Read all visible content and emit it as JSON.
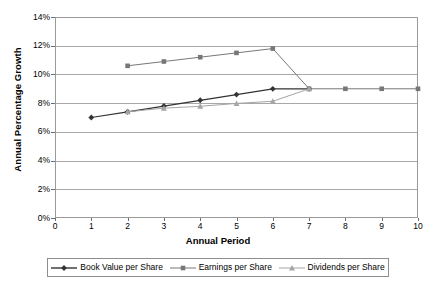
{
  "chart_data": {
    "type": "line",
    "title": "",
    "xlabel": "Annual Period",
    "ylabel": "Annual Percentage Growth",
    "xlim": [
      0,
      10
    ],
    "ylim": [
      0,
      0.14
    ],
    "grid": "horizontal",
    "legend_position": "bottom",
    "x_tick_labels": [
      "0",
      "1",
      "2",
      "3",
      "4",
      "5",
      "6",
      "7",
      "8",
      "9",
      "10"
    ],
    "x_tick_values": [
      0,
      1,
      2,
      3,
      4,
      5,
      6,
      7,
      8,
      9,
      10
    ],
    "y_tick_labels": [
      "0%",
      "2%",
      "4%",
      "6%",
      "8%",
      "10%",
      "12%",
      "14%"
    ],
    "y_tick_values": [
      0,
      0.02,
      0.04,
      0.06,
      0.08,
      0.1,
      0.12,
      0.14
    ],
    "series": [
      {
        "name": "Book Value per Share",
        "marker": "diamond",
        "color": "#333333",
        "x": [
          1,
          2,
          3,
          4,
          5,
          6,
          7
        ],
        "values": [
          0.07,
          0.074,
          0.078,
          0.082,
          0.086,
          0.09,
          0.09
        ]
      },
      {
        "name": "Earnings per Share",
        "marker": "square",
        "color": "#777777",
        "x": [
          2,
          3,
          4,
          5,
          6,
          7,
          8,
          9,
          10
        ],
        "values": [
          0.106,
          0.109,
          0.112,
          0.115,
          0.118,
          0.09,
          0.09,
          0.09,
          0.09
        ]
      },
      {
        "name": "Dividends per Share",
        "marker": "triangle",
        "color": "#a5a5a5",
        "x": [
          2,
          3,
          4,
          5,
          6,
          7
        ],
        "values": [
          0.074,
          0.0765,
          0.0778,
          0.0798,
          0.0813,
          0.09
        ]
      }
    ]
  },
  "legend": {
    "items": [
      {
        "label": "Book Value per Share",
        "marker": "diamond-marker",
        "color": "#333333"
      },
      {
        "label": "Earnings per Share",
        "marker": "square-marker",
        "color": "#777777"
      },
      {
        "label": "Dividends per Share",
        "marker": "triangle-marker",
        "color": "#a5a5a5"
      }
    ]
  },
  "axes": {
    "x_title": "Annual Period",
    "y_title": "Annual Percentage Growth"
  }
}
